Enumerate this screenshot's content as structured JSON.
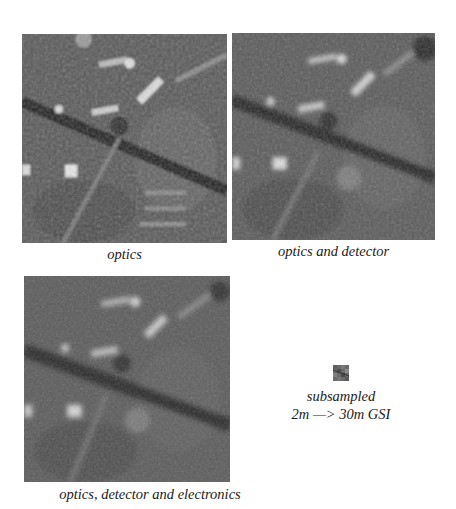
{
  "figure": {
    "panels": [
      {
        "id": "optics",
        "caption": "optics",
        "blur_level": "low"
      },
      {
        "id": "optics-detector",
        "caption": "optics and detector",
        "blur_level": "medium"
      },
      {
        "id": "optics-detector-electronics",
        "caption": "optics, detector and electronics",
        "blur_level": "high"
      },
      {
        "id": "subsampled",
        "caption_line1": "subsampled",
        "caption_line2": "2m —> 30m GSI"
      }
    ],
    "colors": {
      "background": "#ffffff",
      "image_base": "#5a5a5a",
      "road": "#2a2a2a",
      "building": "#c8c8c8",
      "caption": "#1a1a1a"
    }
  }
}
